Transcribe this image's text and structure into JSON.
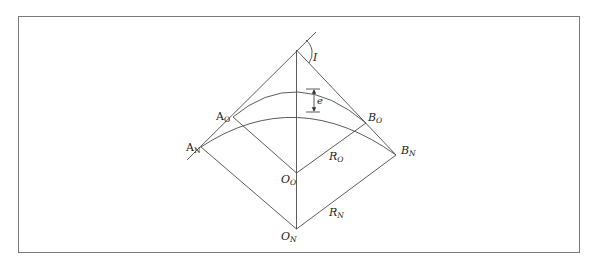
{
  "figure": {
    "frame": {
      "x": 18,
      "y": 16,
      "width": 562,
      "height": 237
    },
    "colors": {
      "stroke": "#4a4a4a",
      "border": "#7a7a7a",
      "text": "#222222"
    },
    "labels": {
      "angle": {
        "text": "I",
        "sub": ""
      },
      "offset": {
        "text": "e",
        "sub": ""
      },
      "A_old": {
        "text": "A",
        "sub": "O"
      },
      "A_new": {
        "text": "A",
        "sub": "N"
      },
      "B_old": {
        "text": "B",
        "sub": "O"
      },
      "B_new": {
        "text": "B",
        "sub": "N"
      },
      "O_old": {
        "text": "O",
        "sub": "O"
      },
      "O_new": {
        "text": "O",
        "sub": "N"
      },
      "R_old": {
        "text": "R",
        "sub": "O"
      },
      "R_new": {
        "text": "R",
        "sub": "N"
      }
    },
    "points": {
      "PI": [
        296.5,
        50
      ],
      "tangent_ext_end": [
        316,
        32
      ],
      "tangent_left_end": [
        187,
        160
      ],
      "A_N": [
        201,
        147
      ],
      "A_O": [
        233,
        117
      ],
      "B_O": [
        366,
        123
      ],
      "B_N": [
        396,
        155
      ],
      "O_O": [
        296.5,
        173
      ],
      "O_N": [
        296.5,
        229
      ]
    },
    "offset_e": {
      "x": 314,
      "y_top": 89,
      "y_bottom": 112
    }
  }
}
